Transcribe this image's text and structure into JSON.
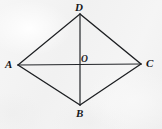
{
  "figure": {
    "caption": "Rhombus ABCD with diagonals AC and BD meeting at O",
    "background_color": "#f2f2f2",
    "stroke_color": "#1d1f22",
    "label_color": "#15171a",
    "stroke_width": 1.1,
    "vertices": [
      {
        "id": "A",
        "label": "A",
        "x": 18,
        "y": 65
      },
      {
        "id": "D",
        "label": "D",
        "x": 80,
        "y": 14
      },
      {
        "id": "C",
        "label": "C",
        "x": 141,
        "y": 64
      },
      {
        "id": "B",
        "label": "B",
        "x": 80,
        "y": 105
      }
    ],
    "center": {
      "id": "O",
      "label": "O",
      "x": 80,
      "y": 65
    },
    "sides": [
      {
        "name": "AD",
        "from": "A",
        "to": "D"
      },
      {
        "name": "DC",
        "from": "D",
        "to": "C"
      },
      {
        "name": "CB",
        "from": "C",
        "to": "B"
      },
      {
        "name": "BA",
        "from": "B",
        "to": "A"
      }
    ],
    "diagonals": [
      {
        "name": "AC",
        "from": "A",
        "to": "C"
      },
      {
        "name": "DB",
        "from": "D",
        "to": "B"
      }
    ]
  }
}
